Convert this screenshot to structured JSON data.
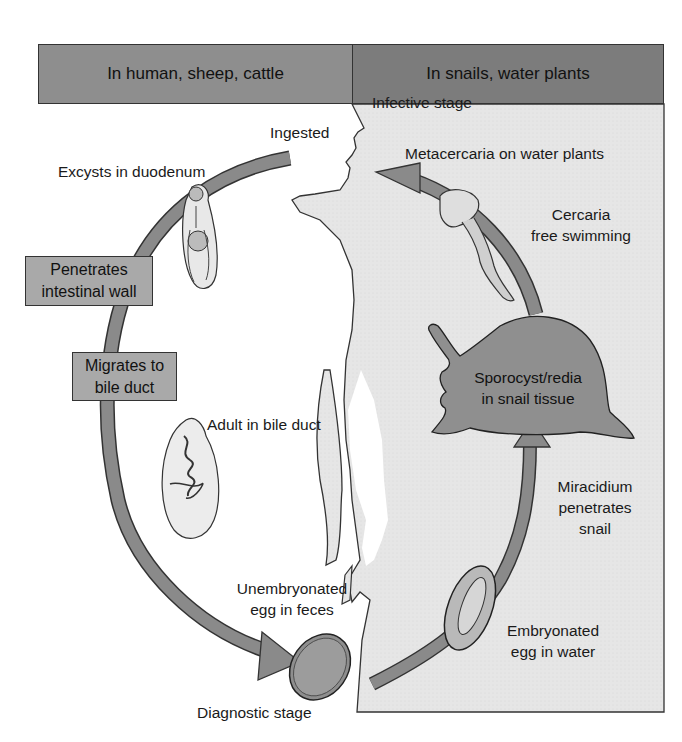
{
  "diagram": {
    "type": "life-cycle",
    "colors": {
      "header_left": "#8e8e8e",
      "header_right": "#7c7c7c",
      "panel_bg": "#e3e3e3",
      "arrow_fill": "#8a8a8a",
      "box_fill": "#a9a9a9",
      "snail_fill": "#8f8f8f",
      "outline": "#222222"
    }
  },
  "headers": {
    "left": "In human, sheep, cattle",
    "right": "In snails, water plants"
  },
  "labels": {
    "infective_stage": "Infective stage",
    "ingested": "Ingested",
    "metacercaria": "Metacercaria on water plants",
    "excysts": "Excysts in duodenum",
    "cercaria_line1": "Cercaria",
    "cercaria_line2": "free swimming",
    "adult": "Adult in bile duct",
    "miracidium_line1": "Miracidium",
    "miracidium_line2": "penetrates",
    "miracidium_line3": "snail",
    "unembryonated_line1": "Unembryonated",
    "unembryonated_line2": "egg in feces",
    "embryonated_line1": "Embryonated",
    "embryonated_line2": "egg in water",
    "diagnostic_stage": "Diagnostic stage"
  },
  "boxes": {
    "penetrates_line1": "Penetrates",
    "penetrates_line2": "intestinal wall",
    "migrates_line1": "Migrates to",
    "migrates_line2": "bile duct"
  },
  "snail": {
    "line1": "Sporocyst/redia",
    "line2": "in snail tissue"
  },
  "stages": [
    {
      "order": 1,
      "name": "Metacercaria on water plants",
      "host": "water plants",
      "note": "Infective stage"
    },
    {
      "order": 2,
      "name": "Ingested",
      "host": "human, sheep, cattle"
    },
    {
      "order": 3,
      "name": "Excysts in duodenum",
      "host": "human, sheep, cattle"
    },
    {
      "order": 4,
      "name": "Penetrates intestinal wall",
      "host": "human, sheep, cattle"
    },
    {
      "order": 5,
      "name": "Migrates to bile duct",
      "host": "human, sheep, cattle"
    },
    {
      "order": 6,
      "name": "Adult in bile duct",
      "host": "human, sheep, cattle"
    },
    {
      "order": 7,
      "name": "Unembryonated egg in feces",
      "host": "human, sheep, cattle",
      "note": "Diagnostic stage"
    },
    {
      "order": 8,
      "name": "Embryonated egg in water",
      "host": "water"
    },
    {
      "order": 9,
      "name": "Miracidium penetrates snail",
      "host": "snail"
    },
    {
      "order": 10,
      "name": "Sporocyst/redia in snail tissue",
      "host": "snail"
    },
    {
      "order": 11,
      "name": "Cercaria free swimming",
      "host": "water"
    }
  ]
}
